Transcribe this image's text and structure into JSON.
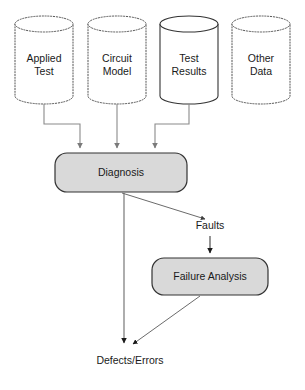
{
  "diagram": {
    "type": "flowchart",
    "colors": {
      "process_fill": "#d9d9d9",
      "process_stroke": "#333333",
      "datastore_stroke_dotted": "#555555",
      "datastore_stroke_solid": "#333333",
      "datastore_fill": "#ffffff",
      "connector": "#6b6b6b",
      "arrow_dark": "#1a1a1a",
      "text": "#1a1a1a"
    },
    "datastores": [
      {
        "id": "applied-test",
        "label": "Applied\nTest",
        "border": "dotted"
      },
      {
        "id": "circuit-model",
        "label": "Circuit\nModel",
        "border": "dotted"
      },
      {
        "id": "test-results",
        "label": "Test\nResults",
        "border": "solid"
      },
      {
        "id": "other-data",
        "label": "Other\nData",
        "border": "dotted"
      }
    ],
    "processes": [
      {
        "id": "diagnosis",
        "label": "Diagnosis"
      },
      {
        "id": "failure-analysis",
        "label": "Failure Analysis"
      }
    ],
    "edge_labels": [
      {
        "id": "faults",
        "label": "Faults"
      },
      {
        "id": "defects-errors",
        "label": "Defects/Errors"
      }
    ],
    "edges": [
      {
        "from": "applied-test",
        "to": "diagnosis",
        "style": "orthogonal"
      },
      {
        "from": "circuit-model",
        "to": "diagnosis",
        "style": "straight"
      },
      {
        "from": "test-results",
        "to": "diagnosis",
        "style": "orthogonal"
      },
      {
        "from": "diagnosis",
        "to": "faults",
        "style": "diagonal"
      },
      {
        "from": "faults",
        "to": "failure-analysis",
        "style": "straight"
      },
      {
        "from": "diagnosis",
        "to": "defects-errors",
        "style": "straight"
      },
      {
        "from": "failure-analysis",
        "to": "defects-errors",
        "style": "diagonal"
      }
    ]
  }
}
